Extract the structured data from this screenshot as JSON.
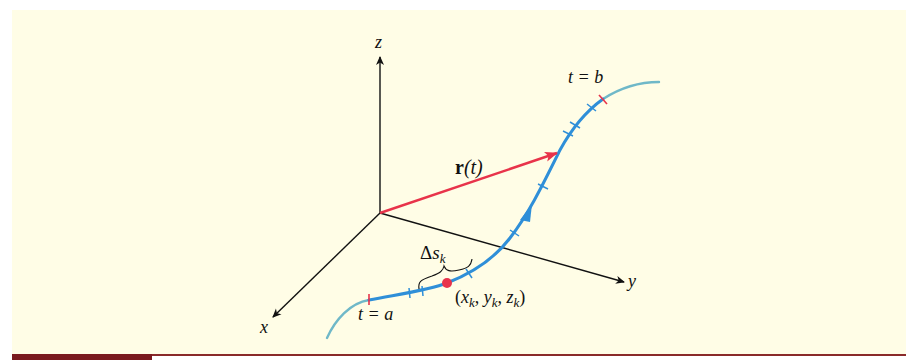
{
  "figure": {
    "background_color": "#fffde6",
    "axis_color": "#111111",
    "vector_color": "#e8334a",
    "curve_color": "#2f8fd8",
    "curve_extension_color": "#6fb8c8",
    "point_color": "#e8334a",
    "labels": {
      "z_axis": "z",
      "x_axis": "x",
      "y_axis": "y",
      "vector_bold": "r",
      "vector_arg": "(t)",
      "t_end": "t = b",
      "t_start": "t = a",
      "delta": "Δ",
      "delta_var": "s",
      "delta_sub": "k",
      "point_open": "(",
      "point_x": "x",
      "point_y": "y",
      "point_z": "z",
      "point_sub": "k",
      "point_sep": ", ",
      "point_close": ")"
    }
  },
  "footer_bar": {
    "accent_color": "#7a1a1e",
    "line_color": "#8a2a2a"
  }
}
